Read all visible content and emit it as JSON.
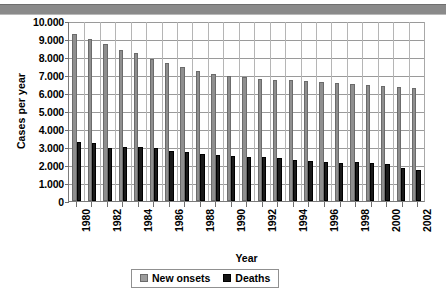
{
  "chart_data": {
    "type": "bar",
    "title": "",
    "xlabel": "Year",
    "ylabel": "Cases per year",
    "ylim": [
      0,
      10000
    ],
    "ystep": 1000,
    "grid": true,
    "legend_position": "bottom",
    "thousands_separator": ".",
    "ytick_labels": [
      "10.000",
      "9.000",
      "8.000",
      "7.000",
      "6.000",
      "5.000",
      "4.000",
      "3.000",
      "2.000",
      "1.000",
      "0"
    ],
    "ytick_values": [
      10000,
      9000,
      8000,
      7000,
      6000,
      5000,
      4000,
      3000,
      2000,
      1000,
      0
    ],
    "categories": [
      1980,
      1981,
      1982,
      1983,
      1984,
      1985,
      1986,
      1987,
      1988,
      1989,
      1990,
      1991,
      1992,
      1993,
      1994,
      1995,
      1996,
      1997,
      1998,
      1999,
      2000,
      2001,
      2002
    ],
    "xtick_labels": [
      "1980",
      "",
      "1982",
      "",
      "1984",
      "",
      "1986",
      "",
      "1988",
      "",
      "1990",
      "",
      "1992",
      "",
      "1994",
      "",
      "1996",
      "",
      "1998",
      "",
      "2000",
      "",
      "2002"
    ],
    "series": [
      {
        "name": "New onsets",
        "color": "#8f8f8f",
        "values": [
          9300,
          9000,
          8700,
          8400,
          8200,
          7900,
          7650,
          7450,
          7250,
          7050,
          6950,
          6900,
          6800,
          6750,
          6700,
          6650,
          6600,
          6550,
          6500,
          6450,
          6400,
          6350,
          6300
        ]
      },
      {
        "name": "Deaths",
        "color": "#1a1a1a",
        "values": [
          3300,
          3250,
          2950,
          3000,
          3000,
          2950,
          2800,
          2700,
          2600,
          2550,
          2500,
          2450,
          2450,
          2400,
          2300,
          2250,
          2150,
          2100,
          2150,
          2100,
          2050,
          1850,
          1750
        ]
      }
    ]
  },
  "legend": {
    "items": [
      {
        "label": "New onsets",
        "swatch": "onsets"
      },
      {
        "label": "Deaths",
        "swatch": "deaths"
      }
    ]
  }
}
